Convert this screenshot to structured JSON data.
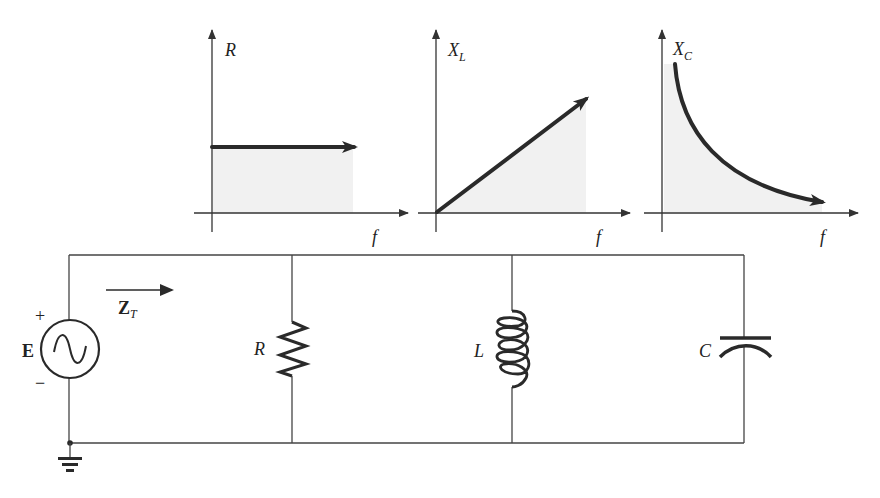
{
  "diagram": {
    "plots": [
      {
        "id": "resistor-plot",
        "y_label": "R",
        "y_label_subscript": "",
        "x_label": "f",
        "behavior": "constant (independent of frequency)"
      },
      {
        "id": "inductor-plot",
        "y_label": "X",
        "y_label_subscript": "L",
        "x_label": "f",
        "behavior": "linear increase with frequency"
      },
      {
        "id": "capacitor-plot",
        "y_label": "X",
        "y_label_subscript": "C",
        "x_label": "f",
        "behavior": "decreases with frequency (inverse)"
      }
    ],
    "circuit": {
      "source": {
        "label": "E",
        "plus": "+",
        "minus": "−",
        "type": "ac-voltage-source"
      },
      "impedance_arrow": {
        "label": "Z",
        "subscript": "T"
      },
      "elements": [
        {
          "id": "resistor",
          "label": "R",
          "symbol": "zigzag"
        },
        {
          "id": "inductor",
          "label": "L",
          "symbol": "coil"
        },
        {
          "id": "capacitor",
          "label": "C",
          "symbol": "plates"
        }
      ],
      "ground": "ground-symbol"
    }
  },
  "colors": {
    "ink": "#2a2a2a",
    "wire": "#444444",
    "shade": "#f1f1f1",
    "background": "#ffffff"
  }
}
